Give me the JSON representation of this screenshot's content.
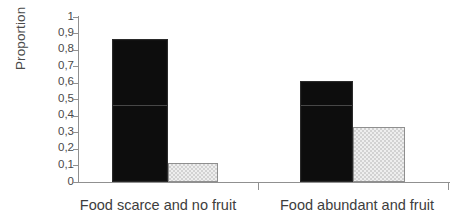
{
  "chart_data": {
    "type": "bar",
    "title": "",
    "subtitle": "",
    "xlabel": "",
    "ylabel": "Proportion",
    "ylim": [
      0,
      1
    ],
    "grid": false,
    "legend": "none",
    "categories": [
      "Food scarce and no fruit",
      "Food abundant and fruit"
    ],
    "series": [
      {
        "name": "dark",
        "color": "#0d0d0d",
        "values": [
          0.865,
          0.615
        ]
      },
      {
        "name": "light",
        "color": "#e0e0e0",
        "values": [
          0.115,
          0.335
        ]
      }
    ],
    "y_ticks": [
      "0",
      "0,1",
      "0,2",
      "0,3",
      "0,4",
      "0,5",
      "0,6",
      "0,7",
      "0,8",
      "0,9",
      "1"
    ],
    "y_tick_values": [
      0,
      0.1,
      0.2,
      0.3,
      0.4,
      0.5,
      0.6,
      0.7,
      0.8,
      0.9,
      1
    ],
    "decimal_separator": ","
  },
  "axis": {
    "y_title": "Proportion",
    "tick_0": "0",
    "tick_01": "0,1",
    "tick_02": "0,2",
    "tick_03": "0,3",
    "tick_04": "0,4",
    "tick_05": "0,5",
    "tick_06": "0,6",
    "tick_07": "0,7",
    "tick_08": "0,8",
    "tick_09": "0,9",
    "tick_1": "1"
  },
  "categories": {
    "cat_1": "Food scarce and no fruit",
    "cat_2": "Food abundant and fruit"
  },
  "colors": {
    "dark_bar": "#0d0d0d",
    "light_bar": "#e0e0e0",
    "axis": "#909090",
    "text": "#3d3d3d"
  }
}
